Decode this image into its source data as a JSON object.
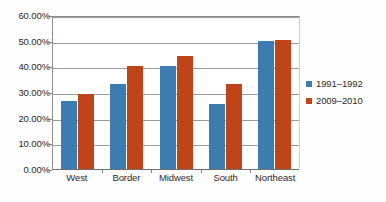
{
  "chart_data": {
    "type": "bar",
    "title": "",
    "subtitle": "",
    "xlabel": "",
    "ylabel": "",
    "ylim": [
      0,
      60
    ],
    "ytick_labels": [
      "0.00%",
      "10.00%",
      "20.00%",
      "30.00%",
      "40.00%",
      "50.00%",
      "60.00%"
    ],
    "ytick_values": [
      0,
      10,
      20,
      30,
      40,
      50,
      60
    ],
    "grid": true,
    "legend_position": "right",
    "categories": [
      "West",
      "Border",
      "Midwest",
      "South",
      "Northeast"
    ],
    "series": [
      {
        "name": "1991–1992",
        "color": "#3d7cb0",
        "values": [
          26.5,
          33.0,
          40.0,
          25.5,
          49.8
        ]
      },
      {
        "name": "2009–2010",
        "color": "#c0441a",
        "values": [
          29.3,
          40.0,
          44.2,
          33.2,
          50.4
        ]
      }
    ],
    "value_suffix": "%"
  },
  "colors": {
    "series_1991_1992": "#3d7cb0",
    "series_2009_2010": "#c0441a",
    "gridline": "#9a9a9a",
    "axis": "#8d8d8d",
    "text": "#2b2b2b",
    "plot_background": "#ffffff",
    "page_background": "#fdfdfd"
  }
}
